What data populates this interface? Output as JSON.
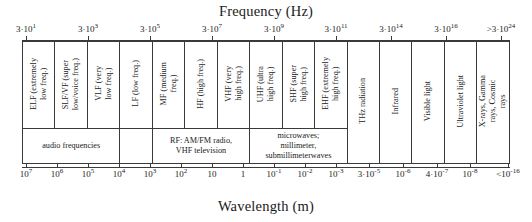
{
  "figure": {
    "top_axis_title": "Frequency (Hz)",
    "bottom_axis_title": "Wavelength (m)"
  },
  "chart_data": {
    "type": "table",
    "title": "Frequency (Hz)",
    "xlabel": "Frequency (Hz)",
    "ylabel": "",
    "secondary_xlabel": "Wavelength (m)",
    "grid": false,
    "legend": "none",
    "frequency_ticks": [
      {
        "base": "3·10",
        "exp": "1",
        "text": "3·10¹",
        "x_px": 26
      },
      {
        "base": "3·10",
        "exp": "3",
        "text": "3·10³",
        "x_px": 88
      },
      {
        "base": "3·10",
        "exp": "5",
        "text": "3·10⁵",
        "x_px": 150
      },
      {
        "base": "3·10",
        "exp": "7",
        "text": "3·10⁷",
        "x_px": 212
      },
      {
        "base": "3·10",
        "exp": "9",
        "text": "3·10⁹",
        "x_px": 274
      },
      {
        "base": "3·10",
        "exp": "11",
        "text": "3·10¹¹",
        "x_px": 336
      },
      {
        "base": "3·10",
        "exp": "14",
        "text": "3·10¹⁴",
        "x_px": 391
      },
      {
        "base": "3·10",
        "exp": "16",
        "text": "3·10¹⁶",
        "x_px": 446
      },
      {
        "base": ">3·10",
        "exp": "24",
        "text": ">3·10²⁴",
        "x_px": 501
      }
    ],
    "wavelength_ticks": [
      {
        "base": "10",
        "exp": "7",
        "text": "10⁷",
        "x_px": 26
      },
      {
        "base": "10",
        "exp": "6",
        "text": "10⁶",
        "x_px": 57
      },
      {
        "base": "10",
        "exp": "5",
        "text": "10⁵",
        "x_px": 88
      },
      {
        "base": "10",
        "exp": "4",
        "text": "10⁴",
        "x_px": 119
      },
      {
        "base": "10",
        "exp": "3",
        "text": "10³",
        "x_px": 150
      },
      {
        "base": "10",
        "exp": "2",
        "text": "10²",
        "x_px": 181
      },
      {
        "base": "10",
        "exp": "",
        "text": "10",
        "x_px": 212
      },
      {
        "base": "1",
        "exp": "",
        "text": "1",
        "x_px": 243
      },
      {
        "base": "10",
        "exp": "-1",
        "text": "10⁻¹",
        "x_px": 274
      },
      {
        "base": "10",
        "exp": "-2",
        "text": "10⁻²",
        "x_px": 305
      },
      {
        "base": "10",
        "exp": "-3",
        "text": "10⁻³",
        "x_px": 336
      },
      {
        "base": "3·10",
        "exp": "-5",
        "text": "3·10⁻⁵",
        "x_px": 369
      },
      {
        "base": "10",
        "exp": "-6",
        "text": "10⁻⁶",
        "x_px": 403
      },
      {
        "base": "4·10",
        "exp": "-7",
        "text": "4·10⁻⁷",
        "x_px": 437
      },
      {
        "base": "10",
        "exp": "-8",
        "text": "10⁻⁸",
        "x_px": 470
      },
      {
        "base": "<10",
        "exp": "-16",
        "text": "<10⁻¹⁶",
        "x_px": 508
      }
    ],
    "bands": [
      {
        "abbr": "ELF",
        "name": "ELF (extremely\nlow freq.)",
        "width_px": 31
      },
      {
        "abbr": "SLF/VF",
        "name": "SLF/VF (super\nlow/voice freq.)",
        "width_px": 31
      },
      {
        "abbr": "VLF",
        "name": "VLF  (very\nlow freq.)",
        "width_px": 31
      },
      {
        "abbr": "LF",
        "name": "LF (low freq.)",
        "width_px": 31
      },
      {
        "abbr": "MF",
        "name": "MF (medium\nfreq.)",
        "width_px": 31
      },
      {
        "abbr": "HF",
        "name": "HF (high freq.)",
        "width_px": 31
      },
      {
        "abbr": "VHF",
        "name": "VHF  (very\nhigh freq.)",
        "width_px": 31
      },
      {
        "abbr": "UHF",
        "name": "UHF  (ultra\nhigh freq.)",
        "width_px": 31
      },
      {
        "abbr": "SHF",
        "name": "SHF  (super\nhigh freq.)",
        "width_px": 31
      },
      {
        "abbr": "EHF",
        "name": "EHF (extremely\nhigh freq.)",
        "width_px": 31
      },
      {
        "abbr": "THz",
        "name": "THz radiation",
        "width_px": 31
      },
      {
        "abbr": "IR",
        "name": "Infrared",
        "width_px": 31
      },
      {
        "abbr": "VIS",
        "name": "Visible light",
        "width_px": 31
      },
      {
        "abbr": "UV",
        "name": "Ultraviolet light",
        "width_px": 31
      },
      {
        "abbr": "XGC",
        "name": "X-rays, Gamma\nrays, Cosmic\nrays",
        "width_px": 31
      }
    ],
    "categories": [
      {
        "label": "audio frequencies",
        "span": 3
      },
      {
        "label": "",
        "span": 1
      },
      {
        "label": "RF: AM/FM radio,\nVHF television",
        "span": 3
      },
      {
        "label": "microwaves;\nmillimeter,\nsubmillimeterwaves",
        "span": 3
      }
    ]
  }
}
